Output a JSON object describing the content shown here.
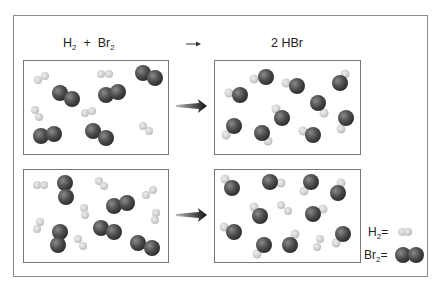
{
  "equation": {
    "reactants": {
      "h2": "H",
      "h2_sub": "2",
      "plus": "+",
      "br2": "Br",
      "br2_sub": "2"
    },
    "product": "2 HBr"
  },
  "legend": {
    "h2_label": "H",
    "h2_sub": "2",
    "h2_eq": "=",
    "br2_label": "Br",
    "br2_sub": "2",
    "br2_eq": "="
  },
  "colors": {
    "br": "#4a4a4a",
    "h": "#c8c8c8",
    "border": "#777777",
    "arrow": "#111111"
  },
  "panels": [
    {
      "name": "top-reactants",
      "x": 23,
      "y": 60,
      "w": 146,
      "h": 95,
      "h2": [
        [
          38,
          80,
          45,
          76
        ],
        [
          35,
          110,
          39,
          117
        ],
        [
          85,
          113,
          92,
          111
        ],
        [
          101,
          74,
          109,
          74
        ],
        [
          143,
          126,
          149,
          131
        ]
      ],
      "br2": [
        [
          60,
          93,
          72,
          99
        ],
        [
          41,
          136,
          54,
          134
        ],
        [
          143,
          73,
          155,
          78
        ],
        [
          106,
          95,
          118,
          92
        ],
        [
          93,
          131,
          106,
          138
        ]
      ],
      "hbr": []
    },
    {
      "name": "top-products",
      "x": 214,
      "y": 60,
      "w": 147,
      "h": 95,
      "h2": [],
      "br2": [],
      "hbr": [
        [
          266,
          77,
          254,
          79
        ],
        [
          240,
          95,
          229,
          93
        ],
        [
          297,
          86,
          286,
          83
        ],
        [
          340,
          83,
          345,
          74
        ],
        [
          318,
          103,
          324,
          113
        ],
        [
          282,
          118,
          276,
          109
        ],
        [
          234,
          126,
          226,
          135
        ],
        [
          262,
          133,
          268,
          141
        ],
        [
          313,
          135,
          303,
          131
        ],
        [
          346,
          118,
          341,
          129
        ]
      ]
    },
    {
      "name": "bottom-reactants",
      "x": 23,
      "y": 169,
      "w": 146,
      "h": 94,
      "h2": [
        [
          37,
          185,
          44,
          185
        ],
        [
          84,
          208,
          85,
          215
        ],
        [
          40,
          222,
          37,
          229
        ],
        [
          78,
          239,
          83,
          246
        ],
        [
          99,
          181,
          104,
          186
        ],
        [
          146,
          195,
          153,
          190
        ],
        [
          156,
          213,
          155,
          220
        ]
      ],
      "br2": [
        [
          65,
          183,
          66,
          197
        ],
        [
          60,
          232,
          58,
          245
        ],
        [
          114,
          206,
          127,
          203
        ],
        [
          101,
          228,
          114,
          232
        ],
        [
          138,
          243,
          152,
          248
        ]
      ],
      "hbr": []
    },
    {
      "name": "bottom-products",
      "x": 214,
      "y": 169,
      "w": 147,
      "h": 94,
      "h2": [
        [
          281,
          205,
          288,
          211
        ],
        [
          320,
          239,
          317,
          247
        ]
      ],
      "br2": [],
      "hbr": [
        [
          232,
          188,
          225,
          179
        ],
        [
          270,
          182,
          281,
          183
        ],
        [
          311,
          182,
          304,
          191
        ],
        [
          338,
          193,
          341,
          183
        ],
        [
          260,
          216,
          254,
          207
        ],
        [
          313,
          214,
          323,
          209
        ],
        [
          234,
          232,
          224,
          227
        ],
        [
          264,
          245,
          257,
          254
        ],
        [
          290,
          245,
          295,
          234
        ],
        [
          343,
          234,
          336,
          243
        ]
      ]
    }
  ]
}
